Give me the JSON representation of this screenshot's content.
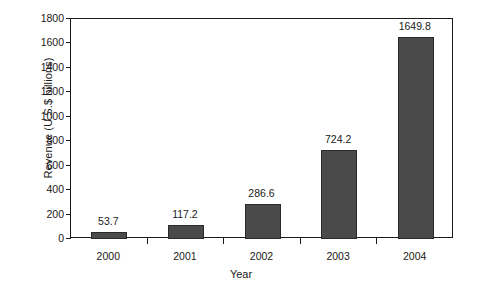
{
  "chart_data": {
    "type": "bar",
    "title": "",
    "subtitle": "",
    "xlabel": "Year",
    "ylabel": "Revenue (U.S.$ billions)",
    "categories": [
      "2000",
      "2001",
      "2002",
      "2003",
      "2004"
    ],
    "values": [
      53.7,
      117.2,
      286.6,
      724.2,
      1649.8
    ],
    "value_labels": [
      "53.7",
      "117.2",
      "286.6",
      "724.2",
      "1649.8"
    ],
    "series": [
      {
        "name": "Revenue",
        "values": [
          53.7,
          117.2,
          286.6,
          724.2,
          1649.8
        ]
      }
    ],
    "ylim": [
      0,
      1800
    ],
    "yticks": [
      0,
      200,
      400,
      600,
      800,
      1000,
      1200,
      1400,
      1600,
      1800
    ],
    "ytick_labels": [
      "0",
      "200",
      "400",
      "600",
      "800",
      "1000",
      "1200",
      "1400",
      "1600",
      "1800"
    ],
    "grid": false,
    "legend": false,
    "legend_position": "none",
    "bar_color": "#4a4a4a",
    "bar_edge_color": "#2a2a2a",
    "axis_color": "#1a1a1a",
    "background_color": "#ffffff"
  },
  "axes": {
    "y_title": "Revenue (U.S.$ billions)",
    "x_title": "Year"
  }
}
